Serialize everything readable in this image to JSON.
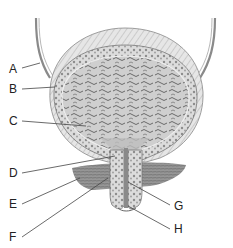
{
  "diagram": {
    "colors": {
      "ink": "#333333",
      "wall_fill": "#d8d8d8",
      "wall_texture": "#8a8a8a",
      "lumen": "#c4c4c4",
      "lumen_texture": "#666666",
      "muscle": "#7a7a7a",
      "leader": "#444444"
    },
    "labels": [
      {
        "letter": "A"
      },
      {
        "letter": "B"
      },
      {
        "letter": "C"
      },
      {
        "letter": "D"
      },
      {
        "letter": "E"
      },
      {
        "letter": "F"
      },
      {
        "letter": "G"
      },
      {
        "letter": "H"
      }
    ]
  }
}
